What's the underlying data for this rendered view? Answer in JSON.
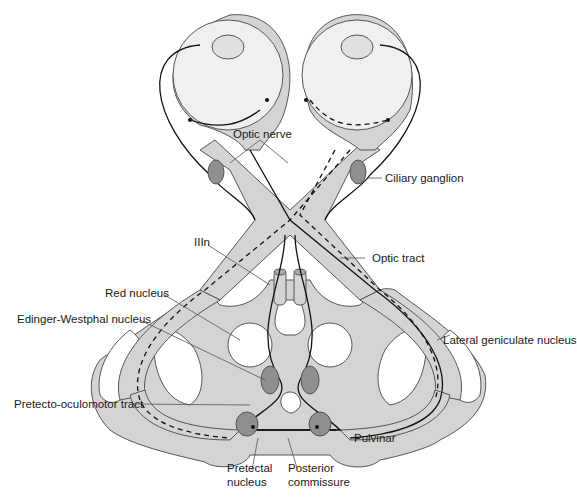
{
  "diagram": {
    "colors": {
      "tissue_fill": "#d4d4d4",
      "tissue_stroke": "#555555",
      "nucleus_fill": "#8f8f8f",
      "background": "#ffffff",
      "line": "#111111"
    },
    "labels": {
      "optic_nerve": "Optic nerve",
      "ciliary_ganglion": "Ciliary ganglion",
      "optic_tract": "Optic tract",
      "iiin": "IIIn",
      "red_nucleus": "Red nucleus",
      "edinger_westphal": "Edinger-Westphal nucleus",
      "lateral_geniculate": "Lateral geniculate nucleus",
      "pretecto_oculomotor": "Pretecto-oculomotor tract",
      "pulvinar": "Pulvinar",
      "pretectal_line1": "Pretectal",
      "pretectal_line2": "nucleus",
      "posterior_line1": "Posterior",
      "posterior_line2": "commissure"
    }
  }
}
